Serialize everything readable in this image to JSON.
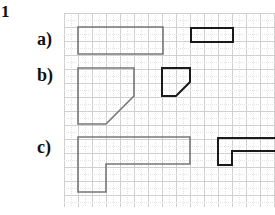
{
  "problem": {
    "number": "1"
  },
  "labels": {
    "a": "a)",
    "b": "b)",
    "c": "c)"
  },
  "colors": {
    "grid_minor": "#e4e4e4",
    "grid_major": "#d0d0d0",
    "original_stroke": "#777777",
    "scaled_stroke": "#1a1a1a"
  },
  "grid": {
    "x0": 64,
    "y0": 13,
    "x1": 275,
    "y1": 207,
    "cell": 7
  },
  "figures": [
    {
      "part": "a",
      "role": "original",
      "points": [
        [
          78,
          27
        ],
        [
          163,
          27
        ],
        [
          163,
          54
        ],
        [
          78,
          54
        ]
      ]
    },
    {
      "part": "a",
      "role": "scaled",
      "points": [
        [
          191,
          28
        ],
        [
          233,
          28
        ],
        [
          233,
          42
        ],
        [
          191,
          42
        ]
      ]
    },
    {
      "part": "b",
      "role": "original",
      "points": [
        [
          78,
          68
        ],
        [
          134,
          68
        ],
        [
          134,
          96
        ],
        [
          106,
          124
        ],
        [
          78,
          124
        ]
      ]
    },
    {
      "part": "b",
      "role": "scaled",
      "points": [
        [
          162,
          68
        ],
        [
          190,
          68
        ],
        [
          190,
          82
        ],
        [
          176,
          96
        ],
        [
          162,
          96
        ]
      ]
    },
    {
      "part": "c",
      "role": "original",
      "points": [
        [
          78,
          137
        ],
        [
          190,
          137
        ],
        [
          190,
          164
        ],
        [
          106,
          164
        ],
        [
          106,
          192
        ],
        [
          78,
          192
        ]
      ]
    },
    {
      "part": "c",
      "role": "scaled",
      "points": [
        [
          218,
          138
        ],
        [
          276,
          138
        ],
        [
          276,
          151
        ],
        [
          232,
          151
        ],
        [
          232,
          165
        ],
        [
          218,
          165
        ]
      ]
    }
  ]
}
